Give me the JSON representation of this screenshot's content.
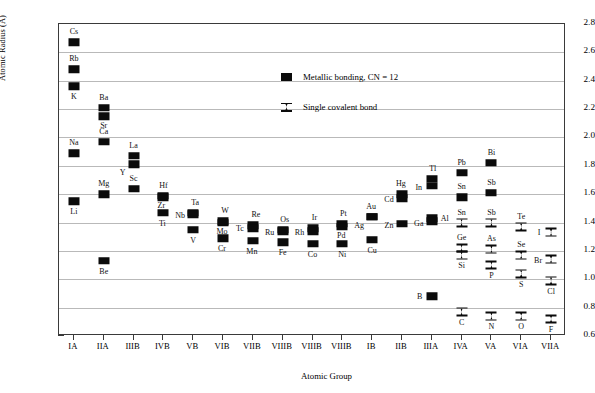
{
  "chart_data": {
    "type": "scatter",
    "title": "",
    "xlabel": "Atomic Group",
    "ylabel": "Atomic Radius (Å)",
    "ylim": [
      0.6,
      2.8
    ],
    "ytick_step": 0.2,
    "yticks": [
      "0.6",
      "0.8",
      "1.0",
      "1.2",
      "1.4",
      "1.6",
      "1.8",
      "2.0",
      "2.2",
      "2.4",
      "2.6",
      "2.8"
    ],
    "grid": "horizontal",
    "categories": [
      "IA",
      "IIA",
      "IIIB",
      "IVB",
      "VB",
      "VIB",
      "VIIB",
      "VIIIB",
      "VIIIB",
      "VIIIB",
      "IB",
      "IIB",
      "IIIA",
      "IVA",
      "VA",
      "VIA",
      "VIIA"
    ],
    "legend_position": "upper-center",
    "series": [
      {
        "name": "Metallic bonding, CN = 12",
        "marker": "filled-square",
        "points": [
          {
            "label": "Cs",
            "group": "IA",
            "gi": 0,
            "y": 2.67,
            "lx": 0,
            "ly": -10
          },
          {
            "label": "Rb",
            "group": "IA",
            "gi": 0,
            "y": 2.48,
            "lx": 0,
            "ly": -10
          },
          {
            "label": "K",
            "group": "IA",
            "gi": 0,
            "y": 2.36,
            "lx": 0,
            "ly": 11
          },
          {
            "label": "Na",
            "group": "IA",
            "gi": 0,
            "y": 1.89,
            "lx": 0,
            "ly": -10
          },
          {
            "label": "Li",
            "group": "IA",
            "gi": 0,
            "y": 1.55,
            "lx": 0,
            "ly": 11
          },
          {
            "label": "Ba",
            "group": "IIA",
            "gi": 1,
            "y": 2.21,
            "lx": 0,
            "ly": -10
          },
          {
            "label": "Sr",
            "group": "IIA",
            "gi": 1,
            "y": 2.15,
            "lx": 0,
            "ly": 10
          },
          {
            "label": "Ca",
            "group": "IIA",
            "gi": 1,
            "y": 1.97,
            "lx": 0,
            "ly": -10
          },
          {
            "label": "Mg",
            "group": "IIA",
            "gi": 1,
            "y": 1.6,
            "lx": 0,
            "ly": -10
          },
          {
            "label": "Be",
            "group": "IIA",
            "gi": 1,
            "y": 1.13,
            "lx": 0,
            "ly": 11
          },
          {
            "label": "La",
            "group": "IIIB",
            "gi": 2,
            "y": 1.87,
            "lx": 0,
            "ly": -10
          },
          {
            "label": "Y",
            "group": "IIIB",
            "gi": 2,
            "y": 1.81,
            "lx": -11,
            "ly": 9
          },
          {
            "label": "Sc",
            "group": "IIIB",
            "gi": 2,
            "y": 1.64,
            "lx": 0,
            "ly": -10
          },
          {
            "label": "Hf",
            "group": "IVB",
            "gi": 3,
            "y": 1.59,
            "lx": 0,
            "ly": -10
          },
          {
            "label": "Zr",
            "group": "IVB",
            "gi": 3,
            "y": 1.58,
            "lx": -2,
            "ly": 9
          },
          {
            "label": "Ti",
            "group": "IVB",
            "gi": 3,
            "y": 1.47,
            "lx": -1,
            "ly": 11
          },
          {
            "label": "Ta",
            "group": "VB",
            "gi": 4,
            "y": 1.47,
            "lx": 2,
            "ly": -10
          },
          {
            "label": "Nb",
            "group": "VB",
            "gi": 4,
            "y": 1.46,
            "lx": -13,
            "ly": 2
          },
          {
            "label": "V",
            "group": "VB",
            "gi": 4,
            "y": 1.35,
            "lx": 0,
            "ly": 11
          },
          {
            "label": "W",
            "group": "VIB",
            "gi": 5,
            "y": 1.41,
            "lx": 2,
            "ly": -10
          },
          {
            "label": "Mo",
            "group": "VIB",
            "gi": 5,
            "y": 1.4,
            "lx": -1,
            "ly": 9
          },
          {
            "label": "Cr",
            "group": "VIB",
            "gi": 5,
            "y": 1.29,
            "lx": -1,
            "ly": 11
          },
          {
            "label": "Re",
            "group": "VIIB",
            "gi": 6,
            "y": 1.38,
            "lx": 3,
            "ly": -10
          },
          {
            "label": "Tc",
            "group": "VIIB",
            "gi": 6,
            "y": 1.36,
            "lx": -13,
            "ly": 1
          },
          {
            "label": "Mn",
            "group": "VIIB",
            "gi": 6,
            "y": 1.27,
            "lx": -1,
            "ly": 11
          },
          {
            "label": "Os",
            "group": "VIIIB",
            "gi": 7,
            "y": 1.35,
            "lx": 2,
            "ly": -10
          },
          {
            "label": "Ru",
            "group": "VIIIB",
            "gi": 7,
            "y": 1.34,
            "lx": -13,
            "ly": 2
          },
          {
            "label": "Fe",
            "group": "VIIIB",
            "gi": 7,
            "y": 1.26,
            "lx": 0,
            "ly": 11
          },
          {
            "label": "Ir",
            "group": "VIIIB",
            "gi": 8,
            "y": 1.36,
            "lx": 2,
            "ly": -10
          },
          {
            "label": "Rh",
            "group": "VIIIB",
            "gi": 8,
            "y": 1.34,
            "lx": -13,
            "ly": 2
          },
          {
            "label": "Co",
            "group": "VIIIB",
            "gi": 8,
            "y": 1.25,
            "lx": 0,
            "ly": 11
          },
          {
            "label": "Pt",
            "group": "VIIIB",
            "gi": 9,
            "y": 1.39,
            "lx": 1,
            "ly": -10
          },
          {
            "label": "Pd",
            "group": "VIIIB",
            "gi": 9,
            "y": 1.37,
            "lx": -1,
            "ly": 9
          },
          {
            "label": "Ni",
            "group": "VIIIB",
            "gi": 9,
            "y": 1.25,
            "lx": 0,
            "ly": 11
          },
          {
            "label": "Au",
            "group": "IB",
            "gi": 10,
            "y": 1.44,
            "lx": -1,
            "ly": -10
          },
          {
            "label": "Ag",
            "group": "IB",
            "gi": 10,
            "y": 1.44,
            "lx": -13,
            "ly": 9
          },
          {
            "label": "Cu",
            "group": "IB",
            "gi": 10,
            "y": 1.28,
            "lx": 0,
            "ly": 11
          },
          {
            "label": "Hg",
            "group": "IIB",
            "gi": 11,
            "y": 1.6,
            "lx": -1,
            "ly": -10
          },
          {
            "label": "Cd",
            "group": "IIB",
            "gi": 11,
            "y": 1.57,
            "lx": -13,
            "ly": 2
          },
          {
            "label": "Zn",
            "group": "IIB",
            "gi": 11,
            "y": 1.39,
            "lx": -13,
            "ly": 2
          },
          {
            "label": "Tl",
            "group": "IIIA",
            "gi": 12,
            "y": 1.71,
            "lx": 1,
            "ly": -10
          },
          {
            "label": "In",
            "group": "IIIA",
            "gi": 12,
            "y": 1.66,
            "lx": -13,
            "ly": 2
          },
          {
            "label": "Al",
            "group": "IIIA",
            "gi": 12,
            "y": 1.43,
            "lx": 13,
            "ly": 1
          },
          {
            "label": "Ga",
            "group": "IIIA",
            "gi": 12,
            "y": 1.41,
            "lx": -13,
            "ly": 3
          },
          {
            "label": "B",
            "group": "IIIA",
            "gi": 12,
            "y": 0.88,
            "lx": -12,
            "ly": 1
          },
          {
            "label": "Pb",
            "group": "IVA",
            "gi": 13,
            "y": 1.75,
            "lx": 0,
            "ly": -10
          },
          {
            "label": "Sn",
            "group": "IVA",
            "gi": 13,
            "y": 1.58,
            "lx": 0,
            "ly": -10
          },
          {
            "label": "Bi",
            "group": "VA",
            "gi": 14,
            "y": 1.82,
            "lx": 0,
            "ly": -10
          },
          {
            "label": "Sb",
            "group": "VA",
            "gi": 14,
            "y": 1.61,
            "lx": 0,
            "ly": -10
          }
        ]
      },
      {
        "name": "Single covalent bond",
        "marker": "bowtie",
        "points": [
          {
            "label": "Sn",
            "group": "IVA",
            "gi": 13,
            "y": 1.4,
            "lx": 0,
            "ly": -10
          },
          {
            "label": "Ge",
            "group": "IVA",
            "gi": 13,
            "y": 1.22,
            "lx": 0,
            "ly": -10
          },
          {
            "label": "Si",
            "group": "IVA",
            "gi": 13,
            "y": 1.17,
            "lx": 0,
            "ly": 11
          },
          {
            "label": "C",
            "group": "IVA",
            "gi": 13,
            "y": 0.77,
            "lx": 0,
            "ly": 11
          },
          {
            "label": "Sb",
            "group": "VA",
            "gi": 14,
            "y": 1.4,
            "lx": 0,
            "ly": -10
          },
          {
            "label": "As",
            "group": "VA",
            "gi": 14,
            "y": 1.21,
            "lx": 0,
            "ly": -10
          },
          {
            "label": "P",
            "group": "VA",
            "gi": 14,
            "y": 1.1,
            "lx": 0,
            "ly": 11
          },
          {
            "label": "N",
            "group": "VA",
            "gi": 14,
            "y": 0.74,
            "lx": 0,
            "ly": 11
          },
          {
            "label": "Te",
            "group": "VIA",
            "gi": 15,
            "y": 1.37,
            "lx": 0,
            "ly": -10
          },
          {
            "label": "Se",
            "group": "VIA",
            "gi": 15,
            "y": 1.17,
            "lx": 0,
            "ly": -10
          },
          {
            "label": "S",
            "group": "VIA",
            "gi": 15,
            "y": 1.04,
            "lx": 0,
            "ly": 11
          },
          {
            "label": "O",
            "group": "VIA",
            "gi": 15,
            "y": 0.74,
            "lx": 0,
            "ly": 11
          },
          {
            "label": "I",
            "group": "VIIA",
            "gi": 16,
            "y": 1.33,
            "lx": -12,
            "ly": 1
          },
          {
            "label": "Br",
            "group": "VIIA",
            "gi": 16,
            "y": 1.14,
            "lx": -13,
            "ly": 2
          },
          {
            "label": "Cl",
            "group": "VIIA",
            "gi": 16,
            "y": 0.99,
            "lx": 0,
            "ly": 11
          },
          {
            "label": "F",
            "group": "VIIA",
            "gi": 16,
            "y": 0.72,
            "lx": 0,
            "ly": 11
          }
        ]
      }
    ]
  },
  "axes": {
    "y_title": "Atomic Radius (Å)",
    "x_title": "Atomic Group"
  },
  "legend": {
    "metallic_label": "Metallic bonding, CN = 12",
    "covalent_label": "Single covalent bond"
  },
  "colors": {
    "marker": "#0b0b0b",
    "grid": "#b9b9b9",
    "frame": "#3a3a3a",
    "background": "#ffffff"
  }
}
